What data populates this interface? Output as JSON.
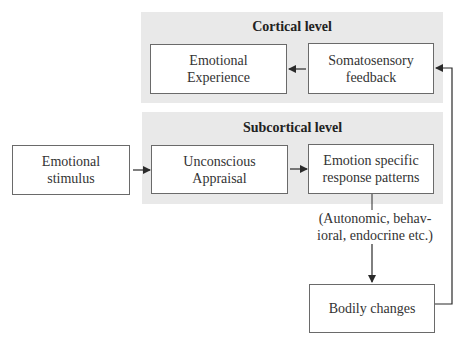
{
  "panels": {
    "cortical": {
      "title": "Cortical level",
      "background": "#e9e9e9"
    },
    "subcortical": {
      "title": "Subcortical level",
      "background": "#e9e9e9"
    }
  },
  "boxes": {
    "emotional_experience": {
      "lines": [
        "Emotional",
        "Experience"
      ]
    },
    "somatosensory_feedback": {
      "lines": [
        "Somatosensory",
        "feedback"
      ]
    },
    "emotional_stimulus": {
      "lines": [
        "Emotional",
        "stimulus"
      ]
    },
    "unconscious_appraisal": {
      "lines": [
        "Unconscious",
        "Appraisal"
      ]
    },
    "emotion_specific": {
      "lines": [
        "Emotion specific",
        "response patterns"
      ]
    },
    "bodily_changes": {
      "lines": [
        "Bodily changes"
      ]
    }
  },
  "annotation": {
    "lines": [
      "(Autonomic, behav-",
      "ioral, endocrine etc.)"
    ]
  },
  "edges": [
    {
      "from": "Emotional stimulus",
      "to": "Unconscious Appraisal"
    },
    {
      "from": "Unconscious Appraisal",
      "to": "Emotion specific response patterns"
    },
    {
      "from": "Emotion specific response patterns",
      "to": "Bodily changes"
    },
    {
      "from": "Bodily changes",
      "to": "Somatosensory feedback"
    },
    {
      "from": "Somatosensory feedback",
      "to": "Emotional Experience"
    }
  ],
  "colors": {
    "line": "#2a2a2a",
    "box_border": "#6a6a6a",
    "panel": "#e9e9e9"
  }
}
